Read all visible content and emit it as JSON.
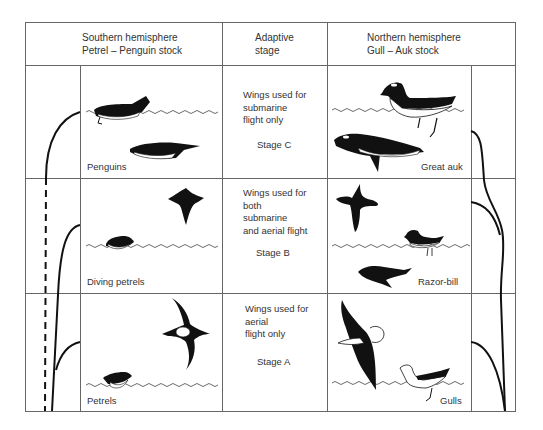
{
  "header": {
    "southern": {
      "line1": "Southern hemisphere",
      "line2": "Petrel – Penguin stock"
    },
    "adaptive": {
      "line1": "Adaptive",
      "line2": "stage"
    },
    "northern": {
      "line1": "Northern hemisphere",
      "line2": "Gull – Auk stock"
    }
  },
  "rows": [
    {
      "stage": "Stage C",
      "description": [
        "Wings used for",
        "submarine",
        "flight only"
      ],
      "southern_label": "Penguins",
      "northern_label": "Great auk"
    },
    {
      "stage": "Stage B",
      "description": [
        "Wings used for",
        "both",
        "submarine",
        "and aerial flight"
      ],
      "southern_label": "Diving petrels",
      "northern_label": "Razor-bill"
    },
    {
      "stage": "Stage A",
      "description": [
        "Wings used for",
        "aerial",
        "flight only"
      ],
      "southern_label": "Petrels",
      "northern_label": "Gulls"
    }
  ],
  "colors": {
    "line": "#555555",
    "ink": "#111111",
    "bg": "#ffffff"
  }
}
